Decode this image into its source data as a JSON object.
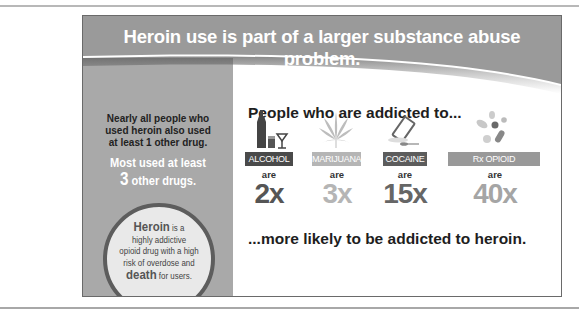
{
  "header": {
    "title": "Heroin use is part of a larger substance abuse problem."
  },
  "sidebar": {
    "fact1_lines": [
      "Nearly all people who",
      "used heroin also used",
      "at least 1 other drug."
    ],
    "fact2_prefix": "Most used at least",
    "fact2_number": "3",
    "fact2_suffix": "other drugs.",
    "circle": {
      "word1": "Heroin",
      "line1_rest": "is a",
      "line2": "highly addictive",
      "line3": "opioid drug with a high",
      "line4": "risk of overdose and",
      "word2": "death",
      "line5_rest": "for users."
    }
  },
  "main": {
    "title": "People who are addicted to...",
    "drugs": [
      {
        "label": "ALCOHOL",
        "icon": "alcohol-icon",
        "are": "are",
        "multiplier": "2x",
        "label_color": "#4a4a4a",
        "mult_color": "#555555"
      },
      {
        "label": "MARIJUANA",
        "icon": "marijuana-leaf-icon",
        "are": "are",
        "multiplier": "3x",
        "label_color": "#b5b5b5",
        "mult_color": "#b5b5b5"
      },
      {
        "label": "COCAINE",
        "icon": "cocaine-icon",
        "are": "are",
        "multiplier": "15x",
        "label_color": "#5c5c5c",
        "mult_color": "#666666"
      },
      {
        "label": "Rx OPIOID PAINKILLERS",
        "icon": "pills-icon",
        "are": "are",
        "multiplier": "40x",
        "label_color": "#999999",
        "mult_color": "#a5a5a5"
      }
    ],
    "footer": "...more likely to be addicted to heroin."
  },
  "colors": {
    "header": "#9a9a9a",
    "sidebar": "#a9a9a9",
    "circle_border": "#5d5d5d",
    "circle_fill": "#e9e9e9"
  }
}
